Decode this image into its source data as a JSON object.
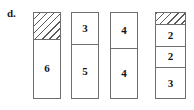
{
  "figure": {
    "label": "d.",
    "bars": [
      {
        "name": "bar-1",
        "segments": [
          {
            "value": "",
            "fill": "hatched",
            "height_units": 26
          },
          {
            "value": "6",
            "fill": "plain",
            "height_units": 60
          }
        ]
      },
      {
        "name": "bar-2",
        "segments": [
          {
            "value": "3",
            "fill": "plain",
            "height_units": 31
          },
          {
            "value": "5",
            "fill": "plain",
            "height_units": 55
          }
        ]
      },
      {
        "name": "bar-3",
        "segments": [
          {
            "value": "4",
            "fill": "plain",
            "height_units": 35
          },
          {
            "value": "4",
            "fill": "plain",
            "height_units": 51
          }
        ]
      },
      {
        "name": "bar-4",
        "segments": [
          {
            "value": "",
            "fill": "hatched",
            "height_units": 11
          },
          {
            "value": "2",
            "fill": "plain",
            "height_units": 22
          },
          {
            "value": "2",
            "fill": "plain",
            "height_units": 22
          },
          {
            "value": "3",
            "fill": "plain",
            "height_units": 31
          }
        ]
      }
    ],
    "geometry": {
      "bars_left": [
        33,
        71,
        110,
        155
      ],
      "bars_width": [
        28,
        28,
        28,
        31
      ],
      "bars_top": 12,
      "bars_bottom": 99
    },
    "colors": {
      "stroke": "#6e6e6e",
      "text": "#141414",
      "hatch": "#5a5a5a",
      "background": "#ffffff"
    }
  }
}
